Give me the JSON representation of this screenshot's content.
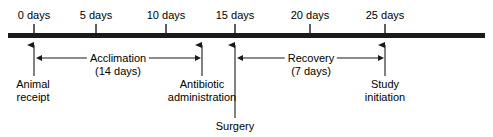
{
  "diagram": {
    "axis": {
      "unit": "days",
      "line_color": "#1a1a1a",
      "ticks": [
        {
          "value": 0,
          "label": "0 days",
          "x": 34
        },
        {
          "value": 5,
          "label": "5 days",
          "x": 96
        },
        {
          "value": 10,
          "label": "10 days",
          "x": 166
        },
        {
          "value": 15,
          "label": "15 days",
          "x": 235
        },
        {
          "value": 20,
          "label": "20 days",
          "x": 310
        },
        {
          "value": 25,
          "label": "25 days",
          "x": 385
        }
      ]
    },
    "events": [
      {
        "id": "animal-receipt",
        "day": 0,
        "x": 34,
        "line1": "Animal",
        "line2": "receipt"
      },
      {
        "id": "antibiotic-administration",
        "day": 12,
        "x": 202,
        "line1": "Antibiotic",
        "line2": "administration"
      },
      {
        "id": "surgery",
        "day": 14,
        "x": 235,
        "line1": "Surgery",
        "line2": ""
      },
      {
        "id": "study-initiation",
        "day": 25,
        "x": 385,
        "line1": "Study",
        "line2": "initiation"
      }
    ],
    "phases": [
      {
        "id": "acclimation",
        "name": "Acclimation",
        "duration": "(14 days)",
        "start_day": 0,
        "end_day": 12,
        "x_start": 42,
        "x_end": 195
      },
      {
        "id": "recovery",
        "name": "Recovery",
        "duration": "(7 days)",
        "start_day": 15,
        "end_day": 25,
        "x_start": 243,
        "x_end": 378
      }
    ]
  }
}
